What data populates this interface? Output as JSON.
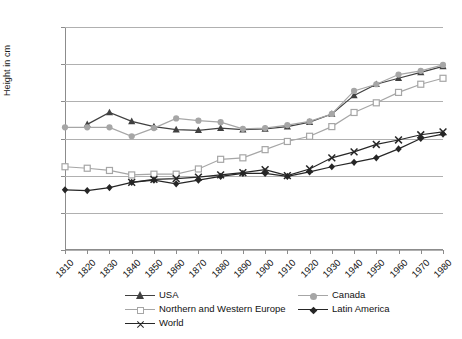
{
  "chart_data": {
    "type": "line",
    "title": "",
    "xlabel": "",
    "ylabel": "Height in cm",
    "ylim": [
      155,
      185
    ],
    "ytick_labels": [
      "185",
      "180",
      "175",
      "170",
      "165",
      "160",
      "155"
    ],
    "ytick_values": [
      185,
      180,
      175,
      170,
      165,
      160,
      155
    ],
    "grid": true,
    "legend_position": "bottom",
    "categories": [
      "1810",
      "1820",
      "1830",
      "1840",
      "1850",
      "1860",
      "1870",
      "1880",
      "1890",
      "1900",
      "1910",
      "1920",
      "1930",
      "1940",
      "1950",
      "1960",
      "1970",
      "1980"
    ],
    "x": [
      1810,
      1820,
      1830,
      1840,
      1850,
      1860,
      1870,
      1880,
      1890,
      1900,
      1910,
      1920,
      1930,
      1940,
      1950,
      1960,
      1970,
      1980
    ],
    "series": [
      {
        "name": "USA",
        "marker": "triangle",
        "color": "#404040",
        "values": [
          null,
          171.9,
          173.5,
          172.3,
          171.6,
          171.2,
          171.1,
          171.4,
          171.2,
          171.3,
          171.6,
          172.2,
          173.3,
          175.8,
          177.3,
          178.1,
          178.9,
          179.7
        ]
      },
      {
        "name": "Canada",
        "marker": "circle",
        "color": "#a6a6a6",
        "values": [
          171.5,
          171.5,
          171.5,
          170.3,
          171.4,
          172.7,
          172.4,
          172.2,
          171.3,
          171.4,
          171.8,
          172.3,
          173.3,
          176.4,
          177.3,
          178.6,
          179.1,
          179.9
        ]
      },
      {
        "name": "Northern and Western Europe",
        "marker": "square",
        "color": "#a6a6a6",
        "values": [
          166.2,
          166.0,
          165.7,
          165.1,
          165.2,
          165.2,
          165.9,
          167.2,
          167.4,
          168.5,
          169.6,
          170.3,
          171.6,
          173.5,
          174.8,
          176.2,
          177.3,
          178.1
        ]
      },
      {
        "name": "Latin America",
        "marker": "diamond",
        "color": "#262626",
        "values": [
          163.1,
          163.0,
          163.4,
          164.1,
          164.4,
          163.9,
          164.4,
          164.9,
          165.3,
          165.3,
          164.9,
          165.5,
          166.2,
          166.8,
          167.4,
          168.6,
          170.0,
          170.6
        ]
      },
      {
        "name": "World",
        "marker": "x",
        "color": "#262626",
        "values": [
          null,
          null,
          null,
          164.1,
          164.5,
          164.6,
          164.8,
          165.1,
          165.4,
          165.8,
          165.0,
          165.9,
          167.4,
          168.2,
          169.2,
          169.8,
          170.5,
          170.9
        ]
      }
    ]
  },
  "legend": {
    "entries": [
      {
        "label": "USA",
        "marker": "triangle",
        "color": "#404040"
      },
      {
        "label": "Canada",
        "marker": "circle",
        "color": "#a6a6a6"
      },
      {
        "label": "Northern and Western Europe",
        "marker": "square",
        "color": "#a6a6a6"
      },
      {
        "label": "Latin America",
        "marker": "diamond",
        "color": "#262626"
      },
      {
        "label": "World",
        "marker": "x",
        "color": "#262626"
      }
    ]
  }
}
